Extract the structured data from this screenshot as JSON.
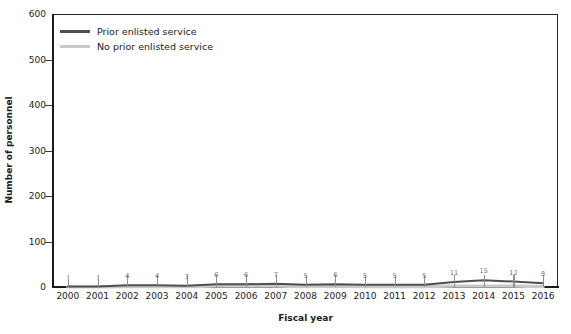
{
  "chart_data": {
    "type": "line",
    "title": "",
    "xlabel": "Fiscal year",
    "ylabel": "Number of personnel",
    "ylim": [
      0,
      600
    ],
    "yticks": [
      0,
      100,
      200,
      300,
      400,
      500,
      600
    ],
    "ytick_labels": [
      "0",
      "100",
      "200",
      "300",
      "400",
      "500",
      "600"
    ],
    "grid": false,
    "legend_position": "top-left",
    "categories": [
      "2000",
      "2001",
      "2002",
      "2003",
      "2004",
      "2005",
      "2006",
      "2007",
      "2008",
      "2009",
      "2010",
      "2011",
      "2012",
      "2013",
      "2014",
      "2015",
      "2016"
    ],
    "series": [
      {
        "name": "Prior enlisted service",
        "color": "#4f4f4f",
        "values": [
          1,
          1,
          4,
          4,
          3,
          6,
          6,
          7,
          5,
          6,
          5,
          5,
          5,
          11,
          15,
          12,
          8
        ],
        "point_labels": [
          "1",
          "1",
          "4",
          "4",
          "3",
          "6",
          "6",
          "7",
          "5",
          "6",
          "5",
          "5",
          "5",
          "11",
          "15",
          "12",
          "8"
        ]
      },
      {
        "name": "No prior enlisted service",
        "color": "#c9c9c9",
        "values": [
          0,
          0,
          1,
          1,
          1,
          2,
          2,
          2,
          1,
          2,
          1,
          1,
          1,
          2,
          2,
          2,
          1
        ],
        "point_labels": []
      }
    ]
  },
  "axes": {
    "y_title": "Number of personnel",
    "x_title": "Fiscal year"
  },
  "legend": {
    "items": [
      {
        "label": "Prior enlisted service",
        "color": "#4f4f4f"
      },
      {
        "label": "No prior enlisted service",
        "color": "#c9c9c9"
      }
    ]
  },
  "colors": {
    "axis": "#1b1b1b",
    "frame": "#2a2a2a",
    "series_dark": "#4f4f4f",
    "series_light": "#c9c9c9",
    "label_text": "#6e6e6e",
    "background": "#ffffff"
  }
}
